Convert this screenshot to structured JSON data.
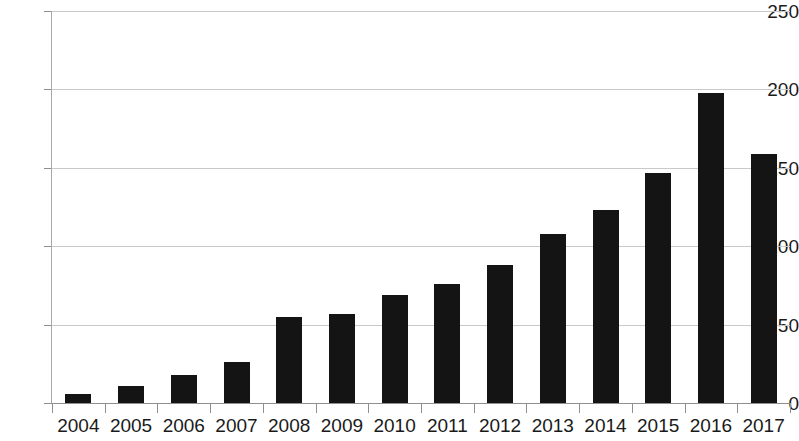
{
  "chart_data": {
    "type": "bar",
    "title": "",
    "subtitle": "",
    "xlabel": "",
    "ylabel": "",
    "categories": [
      "2004",
      "2005",
      "2006",
      "2007",
      "2008",
      "2009",
      "2010",
      "2011",
      "2012",
      "2013",
      "2014",
      "2015",
      "2016",
      "2017"
    ],
    "values": [
      6,
      11,
      18,
      26,
      55,
      57,
      69,
      76,
      88,
      108,
      123,
      147,
      198,
      159
    ],
    "ylim": [
      0,
      250
    ],
    "yticks": [
      0,
      50,
      100,
      150,
      200,
      250
    ],
    "ytick_labels": [
      "0",
      "50",
      "100",
      "150",
      "200",
      "250"
    ],
    "grid": true,
    "grid_axis": "y",
    "legend": false,
    "legend_position": "none",
    "bar_color": "#141414",
    "grid_color": "#c9c9c9",
    "axis_color": "#8f8f8f",
    "background_color": "#ffffff",
    "text_color": "#1a1a1a"
  }
}
